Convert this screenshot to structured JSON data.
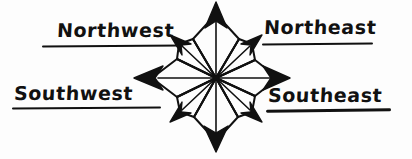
{
  "figure": {
    "kind": "compass-rose-diagram",
    "background_color": "#fdfdfd",
    "ink_color": "#111111"
  },
  "labels": {
    "northwest": "Northwest",
    "northeast": "Northeast",
    "southwest": "Southwest",
    "southeast": "Southeast"
  },
  "compass": {
    "center": {
      "x": 216,
      "y": 78
    },
    "points": [
      {
        "name": "north",
        "bearing_deg": 0,
        "arrow": "up",
        "length": 74,
        "type": "cardinal"
      },
      {
        "name": "northeast",
        "bearing_deg": 45,
        "arrow": "up-right",
        "length": 52,
        "type": "ordinal"
      },
      {
        "name": "east",
        "bearing_deg": 90,
        "arrow": "right",
        "length": 66,
        "type": "cardinal"
      },
      {
        "name": "southeast",
        "bearing_deg": 135,
        "arrow": "down-right",
        "length": 52,
        "type": "ordinal"
      },
      {
        "name": "south",
        "bearing_deg": 180,
        "arrow": "down",
        "length": 70,
        "type": "cardinal"
      },
      {
        "name": "southwest",
        "bearing_deg": 225,
        "arrow": "down-left",
        "length": 52,
        "type": "ordinal"
      },
      {
        "name": "west",
        "bearing_deg": 270,
        "arrow": "left",
        "length": 78,
        "type": "cardinal"
      },
      {
        "name": "northwest",
        "bearing_deg": 315,
        "arrow": "up-left",
        "length": 52,
        "type": "ordinal"
      }
    ],
    "point_count": 8,
    "style": "solid black arrowheads with open kite-shaped petals"
  }
}
